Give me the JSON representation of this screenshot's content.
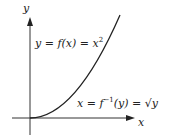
{
  "diagram": {
    "axis_labels": {
      "x": "x",
      "y": "y"
    },
    "curve_label": "y = f(x) = x",
    "curve_label_exp": "2",
    "inverse_label": "x = f",
    "inverse_label_exp": "−1",
    "inverse_label_rest": "(y) = √y",
    "colors": {
      "axis": "#222222",
      "curve": "#222222",
      "background": "#ffffff"
    }
  }
}
